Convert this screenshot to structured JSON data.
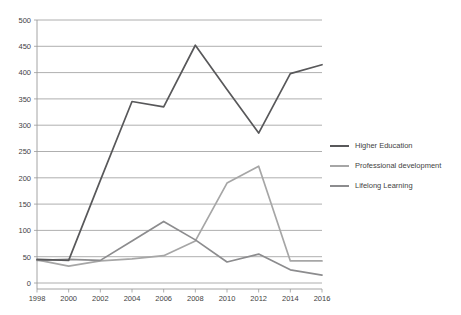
{
  "chart_data": {
    "type": "line",
    "title": "",
    "xlabel": "",
    "ylabel": "",
    "x": [
      1998,
      2000,
      2002,
      2004,
      2006,
      2008,
      2010,
      2012,
      2014,
      2016
    ],
    "categories": [
      "1998",
      "2000",
      "2002",
      "2004",
      "2006",
      "2008",
      "2010",
      "2012",
      "2014",
      "2016"
    ],
    "xlim": [
      1998,
      2016
    ],
    "ylim": [
      0,
      500
    ],
    "ytick_values": [
      0,
      50,
      100,
      150,
      200,
      250,
      300,
      350,
      400,
      450,
      500
    ],
    "ytick_labels": [
      "0",
      "50",
      "100",
      "150",
      "200",
      "250",
      "300",
      "350",
      "400",
      "450",
      "500"
    ],
    "grid": true,
    "legend_position": "right",
    "series": [
      {
        "name": "Higher Education",
        "color": "#58585a",
        "values": [
          45,
          43,
          195,
          345,
          335,
          452,
          368,
          285,
          398,
          415
        ]
      },
      {
        "name": "Professional development",
        "color": "#a6a6a6",
        "values": [
          44,
          32,
          42,
          46,
          52,
          80,
          190,
          222,
          42,
          42
        ]
      },
      {
        "name": "Lifelong Learning",
        "color": "#8c8c8e",
        "values": [
          43,
          45,
          43,
          80,
          117,
          82,
          40,
          55,
          25,
          15
        ]
      }
    ]
  },
  "legend": {
    "items": [
      {
        "label": "Higher Education",
        "color": "#58585a"
      },
      {
        "label": "Professional development",
        "color": "#a6a6a6"
      },
      {
        "label": "Lifelong Learning",
        "color": "#8c8c8e"
      }
    ]
  }
}
